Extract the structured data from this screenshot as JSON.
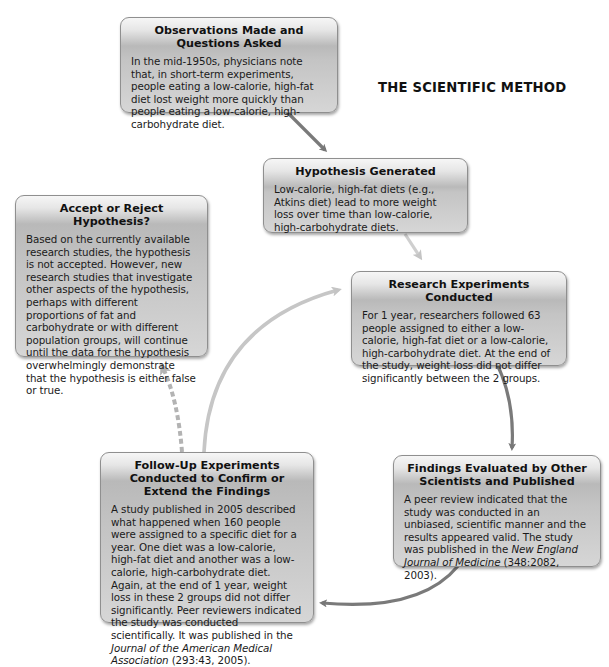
{
  "title": "THE SCIENTIFIC METHOD",
  "colors": {
    "box_fill": "#c4c4c4",
    "box_border": "#8f8f8f",
    "arrow_dark": "#7a7a7a",
    "arrow_light": "#c8c8c8",
    "text": "#1e1e1e"
  },
  "steps": {
    "observations": {
      "title": "Observations Made and Questions Asked",
      "body": "In the mid-1950s, physicians note that, in short-term experiments, people eating a low-calorie, high-fat diet lost weight more quickly than people eating a low-calorie, high-carbohydrate diet."
    },
    "hypothesis": {
      "title": "Hypothesis Generated",
      "body": "Low-calorie, high-fat diets (e.g., Atkins diet) lead to more weight loss over time than low-calorie, high-carbohydrate diets."
    },
    "experiments": {
      "title": "Research Experiments Conducted",
      "body": "For 1 year, researchers followed 63 people assigned to either a low-calorie, high-fat diet or a low-calorie, high-carbohydrate diet. At the end of the study, weight loss did not differ significantly between the 2 groups."
    },
    "findings": {
      "title": "Findings Evaluated by Other Scientists and Published",
      "body_prefix": "A peer review indicated that the study was conducted in an unbiased, scientific manner and the results appeared valid. The study was published in the ",
      "journal": "New England Journal of Medicine",
      "body_suffix": " (348:2082, 2003)."
    },
    "followup": {
      "title": "Follow-Up Experiments Conducted to Confirm or Extend the Findings",
      "body_prefix": "A study published in 2005 described what happened when 160 people were assigned to a specific diet for a year. One diet was a low-calorie, high-fat diet and another was a low-calorie, high-carbohydrate diet. Again, at the end of 1 year, weight loss in these 2 groups did not differ significantly. Peer reviewers indicated the study was conducted scientifically. It was published in the ",
      "journal": "Journal of the American Medical Association",
      "body_suffix": " (293:43, 2005)."
    },
    "accept_reject": {
      "title": "Accept or Reject Hypothesis?",
      "body": "Based on the currently available research studies, the hypothesis is not accepted. However, new research studies that investigate other aspects of the hypothesis, perhaps with different proportions of fat and carbohydrate or with different population groups, will continue until the data for the hypothesis overwhelmingly demonstrate that the hypothesis is either false or true."
    }
  },
  "arrows": [
    {
      "from": "observations",
      "to": "hypothesis",
      "style": "solid-dark"
    },
    {
      "from": "hypothesis",
      "to": "experiments",
      "style": "solid-light"
    },
    {
      "from": "experiments",
      "to": "findings",
      "style": "solid-dark"
    },
    {
      "from": "findings",
      "to": "followup",
      "style": "solid-dark"
    },
    {
      "from": "followup",
      "to": "experiments",
      "style": "solid-light"
    },
    {
      "from": "followup",
      "to": "accept_reject",
      "style": "dashed"
    }
  ]
}
